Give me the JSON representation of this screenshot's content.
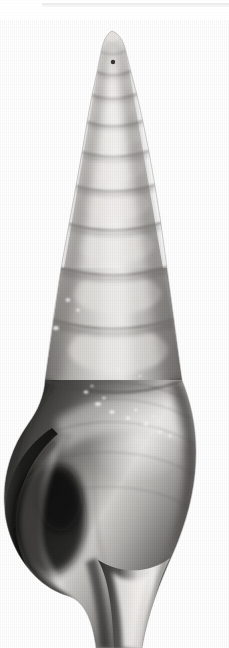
{
  "image": {
    "kind": "photograph",
    "subject": "gastropod-shell-specimen",
    "common_description": "High-spired turreted sea snail shell, apex up, aperture at lower left",
    "orientation": "vertical, apex at top, siphonal canal at bottom",
    "color_mode": "grayscale",
    "background_color": "#ffffff",
    "frame_width_px": 229,
    "frame_height_px": 648,
    "alt_text": "Grayscale photograph of a tall, slender, many-whorled gastropod shell standing upright on a plain white background."
  },
  "palette": {
    "background": "#ffffff",
    "shell_highlight": "#f2f0ee",
    "shell_light": "#d8d6d3",
    "shell_mid": "#a9a7a4",
    "shell_mid_dark": "#7e7c7a",
    "shell_dark": "#4a4947",
    "shell_shadow": "#232322",
    "shell_deep_shadow": "#121211",
    "suture_line": "#6b6967",
    "speckle_white": "#f7f7f5",
    "scan_rule": "#ececec"
  },
  "specimen": {
    "label": "shell-specimen",
    "apex_point": {
      "x": 112,
      "y": 31
    },
    "base_point": {
      "x": 118,
      "y": 648
    },
    "widest_point": {
      "x_left": 2,
      "x_right": 196,
      "y": 470
    },
    "spire": {
      "label": "spire",
      "top_y": 31,
      "bottom_y": 380,
      "whorl_count": 10,
      "whorls": [
        {
          "index": 1,
          "suture_y": 52,
          "left_x": 101,
          "right_x": 126
        },
        {
          "index": 2,
          "suture_y": 72,
          "left_x": 97,
          "right_x": 131
        },
        {
          "index": 3,
          "suture_y": 95,
          "left_x": 92,
          "right_x": 137
        },
        {
          "index": 4,
          "suture_y": 122,
          "left_x": 87,
          "right_x": 143
        },
        {
          "index": 5,
          "suture_y": 152,
          "left_x": 82,
          "right_x": 149
        },
        {
          "index": 6,
          "suture_y": 186,
          "left_x": 76,
          "right_x": 155
        },
        {
          "index": 7,
          "suture_y": 224,
          "left_x": 69,
          "right_x": 161
        },
        {
          "index": 8,
          "suture_y": 268,
          "left_x": 61,
          "right_x": 167
        },
        {
          "index": 9,
          "suture_y": 320,
          "left_x": 53,
          "right_x": 174
        },
        {
          "index": 10,
          "suture_y": 380,
          "left_x": 45,
          "right_x": 182
        }
      ]
    },
    "body_whorl": {
      "label": "body-whorl",
      "top_y": 380,
      "bottom_y": 600,
      "shoulder_y": 430,
      "tone": "dark with bright diagonal highlight band"
    },
    "aperture": {
      "label": "aperture",
      "side": "left",
      "top_y": 430,
      "bottom_y": 620,
      "tone": "deep shadow"
    },
    "outer_lip": {
      "label": "outer-lip",
      "from": {
        "x": 60,
        "y": 432
      },
      "to": {
        "x": 100,
        "y": 620
      }
    },
    "siphonal_canal": {
      "label": "siphonal-canal",
      "top_y": 585,
      "bottom_y": 648,
      "left_x": 92,
      "right_x": 150
    },
    "marks": [
      {
        "name": "apex-pit",
        "x": 113,
        "y": 62,
        "r": 2.2,
        "tone": "dark"
      },
      {
        "name": "speckle",
        "x": 68,
        "y": 300,
        "r": 2.0,
        "tone": "white"
      },
      {
        "name": "speckle",
        "x": 78,
        "y": 310,
        "r": 1.6,
        "tone": "white"
      },
      {
        "name": "speckle",
        "x": 56,
        "y": 328,
        "r": 2.4,
        "tone": "white"
      },
      {
        "name": "speckle-band",
        "x": 86,
        "y": 392,
        "r": 2.0,
        "tone": "white"
      },
      {
        "name": "speckle-band",
        "x": 98,
        "y": 404,
        "r": 2.6,
        "tone": "white"
      },
      {
        "name": "speckle-band",
        "x": 112,
        "y": 412,
        "r": 2.2,
        "tone": "white"
      },
      {
        "name": "speckle-band",
        "x": 128,
        "y": 418,
        "r": 2.0,
        "tone": "white"
      },
      {
        "name": "speckle-band",
        "x": 146,
        "y": 424,
        "r": 2.4,
        "tone": "white"
      },
      {
        "name": "speckle-band",
        "x": 160,
        "y": 432,
        "r": 1.8,
        "tone": "white"
      },
      {
        "name": "speckle-right",
        "x": 170,
        "y": 436,
        "r": 1.6,
        "tone": "white"
      }
    ]
  },
  "artifacts": {
    "top_rule": {
      "label": "scan-edge-line",
      "x": 42,
      "y": 3,
      "width": 187,
      "height": 3,
      "color": "#ececec"
    },
    "vertical_scan_striping": true,
    "film_grain": true
  }
}
